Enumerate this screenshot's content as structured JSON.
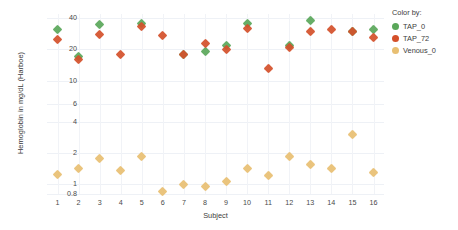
{
  "chart_data": {
    "type": "scatter",
    "title": "",
    "xlabel": "Subject",
    "ylabel": "Hemoglobin in mg/dL (Harboe)",
    "yscale": "log",
    "ylim": [
      0.8,
      44
    ],
    "ytick_labels": [
      "40",
      "20",
      "10",
      "6",
      "4",
      "2",
      "1",
      "0.8"
    ],
    "ytick_values": [
      40,
      20,
      10,
      6,
      4,
      2,
      1,
      0.8
    ],
    "categories": [
      "1",
      "2",
      "3",
      "4",
      "5",
      "6",
      "7",
      "8",
      "9",
      "10",
      "11",
      "12",
      "13",
      "14",
      "15",
      "16"
    ],
    "grid": true,
    "legend_position": "right",
    "legend_title": "Color by:",
    "series": [
      {
        "name": "TAP_0",
        "color": "#5aa75a",
        "marker": "diamond",
        "values": [
          31,
          17,
          35,
          null,
          36,
          null,
          18,
          19,
          22,
          36,
          null,
          22,
          38,
          null,
          30,
          31
        ]
      },
      {
        "name": "TAP_72",
        "color": "#d4502a",
        "marker": "diamond",
        "values": [
          25,
          16,
          28,
          18,
          33,
          27,
          18,
          23,
          20,
          32,
          13,
          21,
          30,
          31,
          30,
          26
        ]
      },
      {
        "name": "Venous_0",
        "color": "#e8bf72",
        "marker": "diamond",
        "values": [
          1.25,
          1.4,
          1.75,
          1.35,
          1.85,
          0.85,
          1.0,
          0.95,
          1.05,
          1.4,
          1.2,
          1.85,
          1.55,
          1.4,
          3.0,
          1.3
        ]
      }
    ]
  },
  "axes": {
    "y_title": "Hemoglobin in mg/dL (Harboe)",
    "x_title": "Subject"
  },
  "legend": {
    "title": "Color by:",
    "items": [
      {
        "label": "TAP_0",
        "color": "#5aa75a"
      },
      {
        "label": "TAP_72",
        "color": "#d4502a"
      },
      {
        "label": "Venous_0",
        "color": "#e8bf72"
      }
    ]
  }
}
